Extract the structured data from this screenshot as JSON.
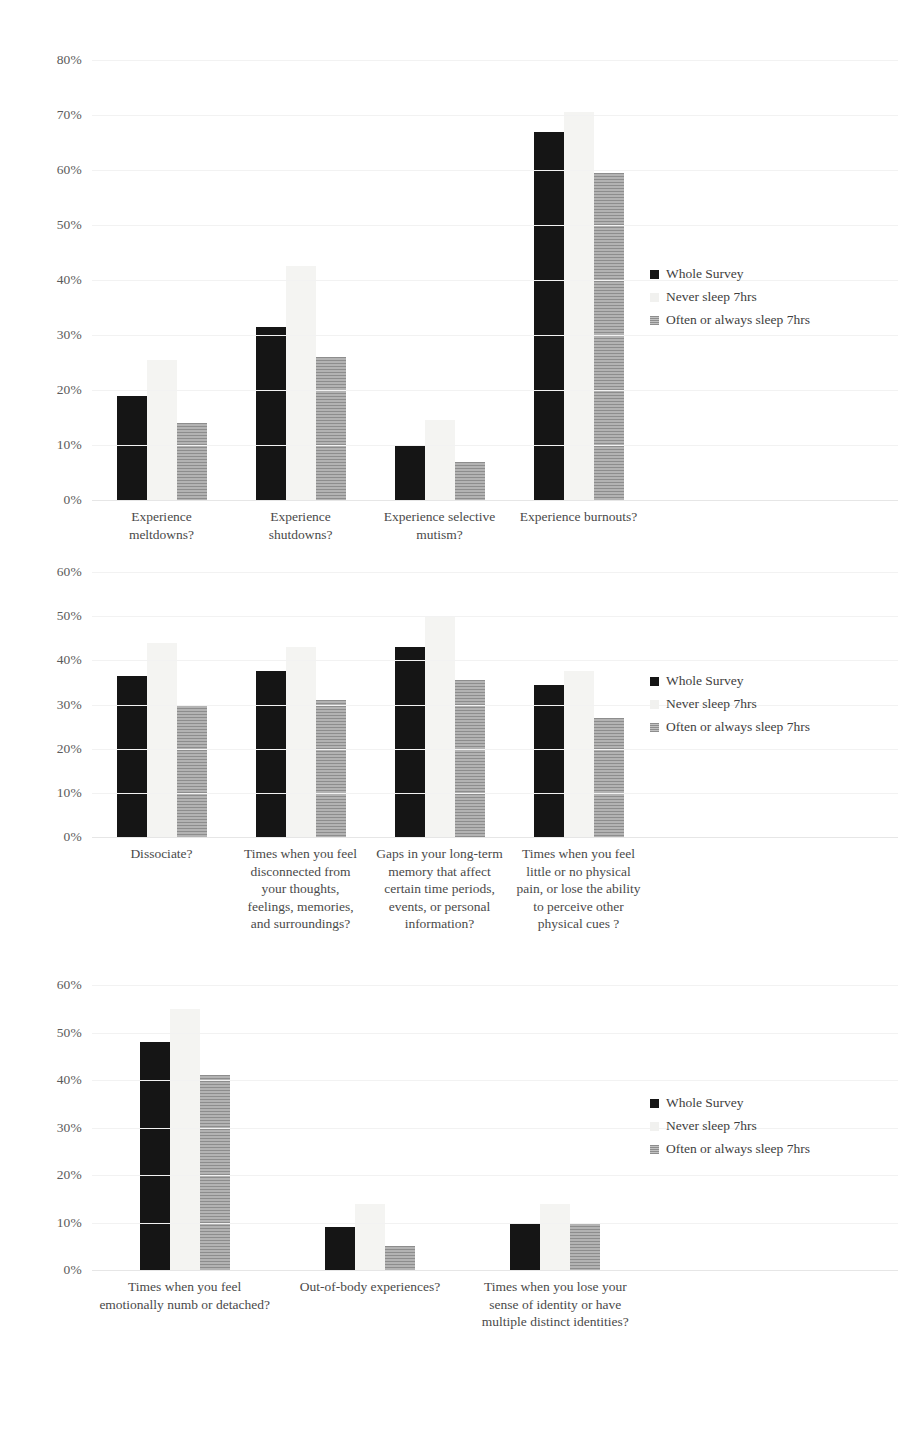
{
  "legend": {
    "entries": [
      {
        "label": "Whole Survey",
        "color": "#151515"
      },
      {
        "label": "Never sleep 7hrs",
        "color": "#f1f1ef"
      },
      {
        "label": "Often or always sleep 7hrs",
        "color": "#9b9b9b"
      }
    ]
  },
  "charts": [
    {
      "name": "autistic-traits-chart",
      "ylim_max": 80,
      "yticks": [
        "0%",
        "10%",
        "20%",
        "30%",
        "40%",
        "50%",
        "60%",
        "70%",
        "80%"
      ],
      "categories": [
        "Experience meltdowns?",
        "Experience shutdowns?",
        "Experience selective mutism?",
        "Experience burnouts?"
      ]
    },
    {
      "name": "dissociation-chart",
      "ylim_max": 60,
      "yticks": [
        "0%",
        "10%",
        "20%",
        "30%",
        "40%",
        "50%",
        "60%"
      ],
      "categories": [
        "Dissociate?",
        "Times when you feel disconnected from your thoughts, feelings, memories, and surroundings?",
        "Gaps in your long-term memory that affect certain time periods, events, or personal information?",
        "Times when you feel little or no physical pain, or lose the ability to perceive other physical cues ?"
      ]
    },
    {
      "name": "depersonalization-chart",
      "ylim_max": 60,
      "yticks": [
        "0%",
        "10%",
        "20%",
        "30%",
        "40%",
        "50%",
        "60%"
      ],
      "categories": [
        "Times when you feel emotionally numb or detached?",
        "Out-of-body experiences?",
        "Times when you lose your sense of identity or have multiple distinct identities?"
      ]
    }
  ],
  "chart_data": [
    {
      "type": "bar",
      "title": "",
      "xlabel": "",
      "ylabel": "",
      "ylim": [
        0,
        80
      ],
      "grid": true,
      "legend_position": "right",
      "categories": [
        "Experience meltdowns?",
        "Experience shutdowns?",
        "Experience selective mutism?",
        "Experience burnouts?"
      ],
      "series": [
        {
          "name": "Whole Survey",
          "values": [
            19,
            31.5,
            10,
            67
          ]
        },
        {
          "name": "Never sleep 7hrs",
          "values": [
            25.5,
            42.5,
            14.5,
            70.5
          ]
        },
        {
          "name": "Often or always sleep 7hrs",
          "values": [
            14,
            26,
            7,
            59.5
          ]
        }
      ]
    },
    {
      "type": "bar",
      "title": "",
      "xlabel": "",
      "ylabel": "",
      "ylim": [
        0,
        60
      ],
      "grid": true,
      "legend_position": "right",
      "categories": [
        "Dissociate?",
        "Times when you feel disconnected from your thoughts, feelings, memories, and surroundings?",
        "Gaps in your long-term memory that affect certain time periods, events, or personal information?",
        "Times when you feel little or no physical pain, or lose the ability to perceive other physical cues ?"
      ],
      "series": [
        {
          "name": "Whole Survey",
          "values": [
            36.5,
            37.5,
            43,
            34.5
          ]
        },
        {
          "name": "Never sleep 7hrs",
          "values": [
            44,
            43,
            50,
            37.5
          ]
        },
        {
          "name": "Often or always sleep 7hrs",
          "values": [
            30,
            31,
            35.5,
            27
          ]
        }
      ]
    },
    {
      "type": "bar",
      "title": "",
      "xlabel": "",
      "ylabel": "",
      "ylim": [
        0,
        60
      ],
      "grid": true,
      "legend_position": "right",
      "categories": [
        "Times when you feel emotionally numb or detached?",
        "Out-of-body experiences?",
        "Times when you lose your sense of identity or have multiple distinct identities?"
      ],
      "series": [
        {
          "name": "Whole Survey",
          "values": [
            48,
            9,
            10
          ]
        },
        {
          "name": "Never sleep 7hrs",
          "values": [
            55,
            14,
            14
          ]
        },
        {
          "name": "Often or always sleep 7hrs",
          "values": [
            41,
            5,
            10
          ]
        }
      ]
    }
  ]
}
